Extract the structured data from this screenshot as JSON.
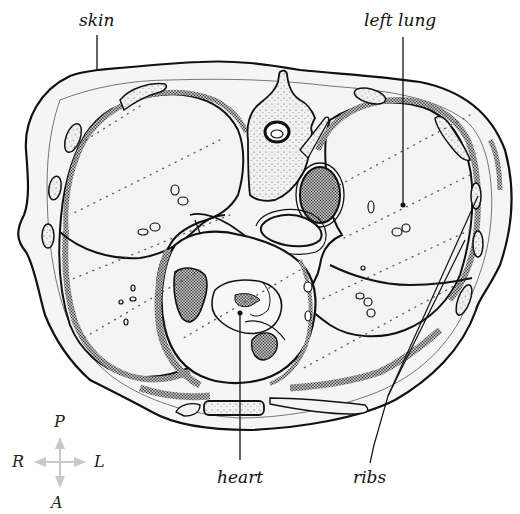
{
  "diagram": {
    "labels": {
      "skin": "skin",
      "left_lung": "left lung",
      "heart": "heart",
      "ribs": "ribs"
    },
    "orientation": {
      "posterior": "P",
      "anterior": "A",
      "right": "R",
      "left": "L",
      "arrow_color": "#c8c8c8"
    },
    "colors": {
      "outline": "#111111",
      "tissue_fill": "#f4f4f4",
      "stipple": "#333333",
      "background": "#ffffff"
    }
  }
}
